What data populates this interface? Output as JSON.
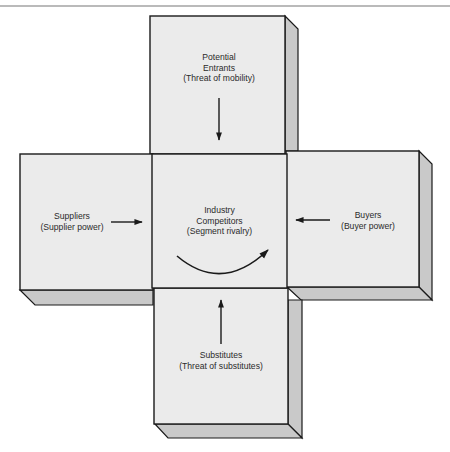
{
  "diagram": {
    "colors": {
      "face": "#ebebeb",
      "side": "#c9c9c9",
      "stroke": "#1a1a1a",
      "text": "#2a2a2a"
    },
    "boxes": {
      "top": {
        "lines": [
          "Potential",
          "Entrants",
          "(Threat of mobility)"
        ],
        "arrow_direction": "down"
      },
      "left": {
        "lines": [
          "Suppliers",
          "(Supplier power)"
        ],
        "arrow_direction": "right"
      },
      "center": {
        "lines": [
          "Industry",
          "Competitors",
          "(Segment rivalry)"
        ],
        "arrow_type": "curved"
      },
      "right": {
        "lines": [
          "Buyers",
          "(Buyer power)"
        ],
        "arrow_direction": "left"
      },
      "bottom": {
        "lines": [
          "Substitutes",
          "(Threat of substitutes)"
        ],
        "arrow_direction": "up"
      }
    }
  }
}
